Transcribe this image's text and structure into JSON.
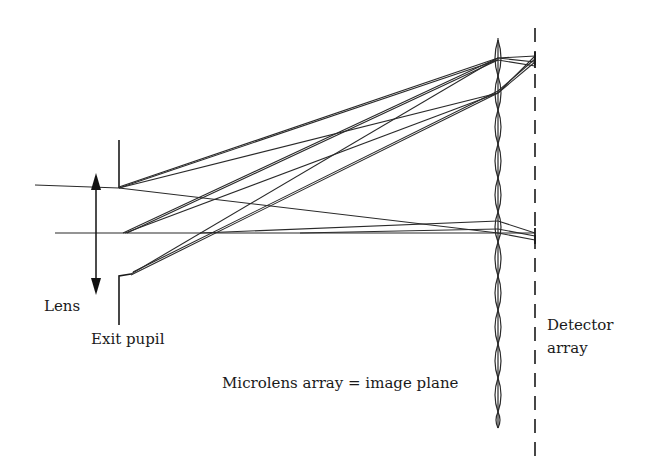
{
  "diagram": {
    "type": "optical ray diagram (plenoptic / light-field camera)",
    "labels": {
      "lens": "Lens",
      "exit_pupil": "Exit pupil",
      "microlens_array": "Microlens array = image plane",
      "detector_line1": "Detector",
      "detector_line2": "array"
    },
    "colors": {
      "background": "#ffffff",
      "ink": "#1a1a1a"
    },
    "elements": [
      {
        "name": "lens",
        "kind": "double-headed vertical arrow"
      },
      {
        "name": "exit-pupil",
        "kind": "aperture stop (two vertical segments)"
      },
      {
        "name": "optical-axis",
        "kind": "horizontal line"
      },
      {
        "name": "microlens-array",
        "kind": "column of lenslets at image plane"
      },
      {
        "name": "detector-array",
        "kind": "dashed vertical line"
      },
      {
        "name": "ray-bundles",
        "kind": "rays from pupil converging on microlenses and diverging to detector"
      }
    ]
  }
}
